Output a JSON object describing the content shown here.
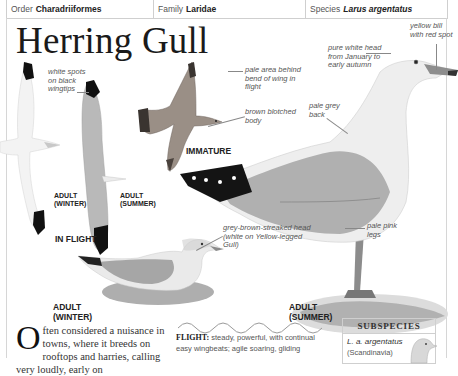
{
  "header": {
    "order_label": "Order",
    "order_value": "Charadriiformes",
    "family_label": "Family",
    "family_value": "Laridae",
    "species_label": "Species",
    "species_value": "Larus argentatus"
  },
  "title": "Herring Gull",
  "annotations": {
    "wingtips": "white spots on black wingtips",
    "bend_of_wing": "pale area behind bend of wing in flight",
    "brown_body": "brown blotched body",
    "white_head": "pure white head from January to early autumn",
    "bill": "yellow bill with red spot",
    "pale_grey_back": "pale grey back",
    "streaked_head": "grey-brown-streaked head (white on Yellow-legged Gull)",
    "legs": "pale pink legs"
  },
  "captions": {
    "adult_winter_flight_1": "ADULT",
    "adult_winter_flight_2": "(WINTER)",
    "adult_summer_flight_1": "ADULT",
    "adult_summer_flight_2": "(SUMMER)",
    "in_flight": "IN FLIGHT",
    "immature": "IMMATURE",
    "adult_winter_1": "ADULT",
    "adult_winter_2": "(WINTER)",
    "adult_summer_1": "ADULT",
    "adult_summer_2": "(SUMMER)"
  },
  "body": {
    "dropcap": "O",
    "text": "ften considered a nuisance in towns, where it breeds on rooftops and harries, calling very loudly, early on"
  },
  "flight": {
    "label": "FLIGHT:",
    "text": "steady, powerful, with continual easy wingbeats; agile soaring, gliding"
  },
  "subspecies": {
    "heading": "SUBSPECIES",
    "name": "L. a. argentatus",
    "region": "(Scandinavia)"
  },
  "colors": {
    "wingtip_black": "#111111",
    "grey_back": "#a9a9a9",
    "bill_yellow": "#9a9a9a",
    "border": "#cfcfcf"
  }
}
